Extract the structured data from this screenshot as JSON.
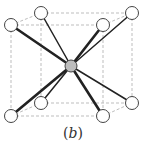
{
  "figure": {
    "caption_open": "(",
    "caption_letter": "b",
    "caption_close": ")",
    "structure": "body-centered cubic unit cell",
    "colors": {
      "edge": "#bdbdbd",
      "bond": "#222222",
      "corner_fill": "#ffffff",
      "corner_stroke": "#444444",
      "center_fill": "#bdbdbd",
      "center_stroke": "#444444"
    },
    "center_atom": {
      "x": 71,
      "y": 66,
      "r": 6
    },
    "corner_atoms": [
      {
        "id": "front-top-left",
        "x": 11,
        "y": 25,
        "r": 6.5,
        "front": true
      },
      {
        "id": "front-top-right",
        "x": 103,
        "y": 25,
        "r": 6.5,
        "front": true
      },
      {
        "id": "front-bottom-left",
        "x": 11,
        "y": 116,
        "r": 6.5,
        "front": true
      },
      {
        "id": "front-bottom-right",
        "x": 103,
        "y": 116,
        "r": 6.5,
        "front": true
      },
      {
        "id": "back-top-left",
        "x": 41,
        "y": 13,
        "r": 6.5,
        "front": false
      },
      {
        "id": "back-top-right",
        "x": 132,
        "y": 13,
        "r": 6.5,
        "front": false
      },
      {
        "id": "back-bottom-left",
        "x": 41,
        "y": 103,
        "r": 6.5,
        "front": false
      },
      {
        "id": "back-bottom-right",
        "x": 132,
        "y": 103,
        "r": 6.5,
        "front": false
      }
    ],
    "cube_edges": [
      [
        "front-top-left",
        "front-top-right"
      ],
      [
        "front-bottom-left",
        "front-bottom-right"
      ],
      [
        "front-top-left",
        "front-bottom-left"
      ],
      [
        "front-top-right",
        "front-bottom-right"
      ],
      [
        "back-top-left",
        "back-top-right"
      ],
      [
        "back-bottom-left",
        "back-bottom-right"
      ],
      [
        "back-top-left",
        "back-bottom-left"
      ],
      [
        "back-top-right",
        "back-bottom-right"
      ],
      [
        "front-top-left",
        "back-top-left"
      ],
      [
        "front-top-right",
        "back-top-right"
      ],
      [
        "front-bottom-left",
        "back-bottom-left"
      ],
      [
        "front-bottom-right",
        "back-bottom-right"
      ]
    ],
    "bond_widths": {
      "front": 2.6,
      "back": 1.5
    }
  }
}
